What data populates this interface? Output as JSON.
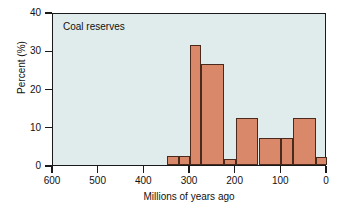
{
  "chart_data": {
    "type": "bar",
    "title": "",
    "annotation": "Coal reserves",
    "xlabel": "Millions of years ago",
    "ylabel": "Percent (%)",
    "xlim": [
      600,
      0
    ],
    "ylim": [
      0,
      40
    ],
    "x_reversed": true,
    "grid": false,
    "legend": null,
    "xticks": [
      600,
      500,
      400,
      300,
      200,
      100,
      0
    ],
    "xtick_labels": [
      "600",
      "500",
      "400",
      "300",
      "200",
      "100",
      "0"
    ],
    "yticks": [
      0,
      10,
      20,
      30,
      40
    ],
    "ytick_labels": [
      "0",
      "10",
      "20",
      "30",
      "40"
    ],
    "bin_edges_ma": [
      350,
      325,
      300,
      275,
      225,
      200,
      150,
      100,
      75,
      25,
      0
    ],
    "bars": [
      {
        "x_start_ma": 350,
        "x_end_ma": 325,
        "value": 2.3
      },
      {
        "x_start_ma": 325,
        "x_end_ma": 300,
        "value": 2.3
      },
      {
        "x_start_ma": 300,
        "x_end_ma": 275,
        "value": 31.5
      },
      {
        "x_start_ma": 275,
        "x_end_ma": 225,
        "value": 26.5
      },
      {
        "x_start_ma": 225,
        "x_end_ma": 200,
        "value": 1.5
      },
      {
        "x_start_ma": 200,
        "x_end_ma": 150,
        "value": 12.2
      },
      {
        "x_start_ma": 150,
        "x_end_ma": 100,
        "value": 7.0
      },
      {
        "x_start_ma": 100,
        "x_end_ma": 75,
        "value": 7.0
      },
      {
        "x_start_ma": 75,
        "x_end_ma": 25,
        "value": 12.2
      },
      {
        "x_start_ma": 25,
        "x_end_ma": 0,
        "value": 2.1
      }
    ],
    "colors": {
      "bar_fill": "#d9886a",
      "bar_edge": "#4a2a1c",
      "plot_background": "#dfeceb",
      "axis": "#1a1a1a",
      "text": "#111111",
      "figure_background": "#ffffff"
    }
  }
}
